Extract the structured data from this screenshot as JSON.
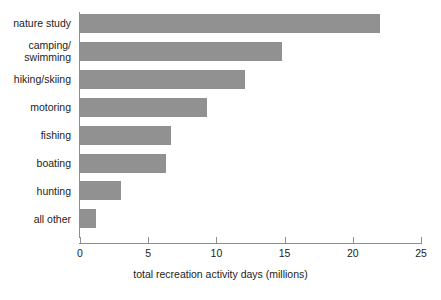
{
  "chart_data": {
    "type": "bar",
    "orientation": "horizontal",
    "title": "",
    "xlabel": "total recreation activity days (millions)",
    "ylabel": "",
    "categories": [
      "nature study",
      "camping/\nswimming",
      "hiking/skiing",
      "motoring",
      "fishing",
      "boating",
      "hunting",
      "all other"
    ],
    "values": [
      22.0,
      14.8,
      12.1,
      9.3,
      6.7,
      6.3,
      3.0,
      1.2
    ],
    "xlim": [
      0,
      25
    ],
    "xticks": [
      0,
      5,
      10,
      15,
      20,
      25
    ],
    "xtick_labels": [
      "0",
      "5",
      "10",
      "15",
      "20",
      "25"
    ],
    "grid": false,
    "legend": null,
    "bar_color": "#919191",
    "axis_color": "#8d8d8d",
    "text_color": "#1c1c1c",
    "background_color": "#ffffff"
  }
}
